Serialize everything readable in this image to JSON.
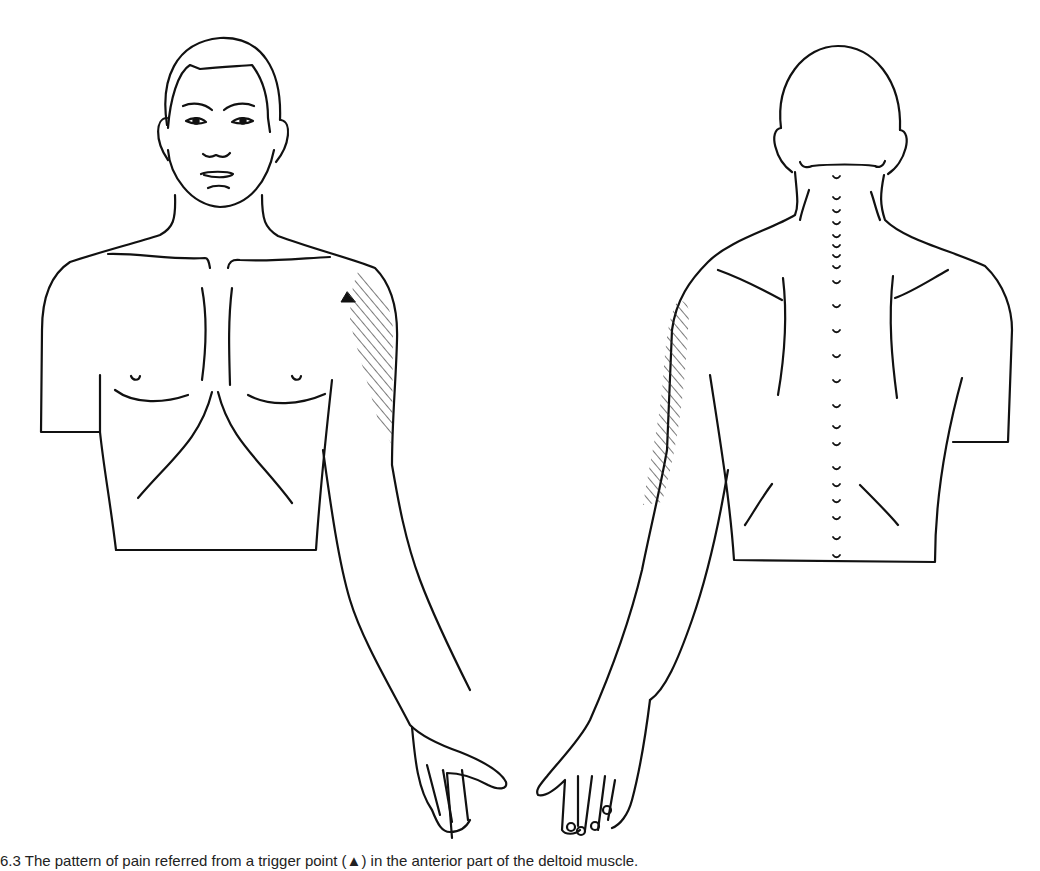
{
  "figure": {
    "views": [
      {
        "id": "front",
        "label": "Anterior view"
      },
      {
        "id": "back",
        "label": "Posterior view"
      }
    ],
    "marker": {
      "symbol": "▲",
      "meaning": "trigger-point"
    },
    "colors": {
      "line": "#111111",
      "background": "#ffffff",
      "hatch": "#333333"
    }
  },
  "caption": "6.3  The pattern of pain referred from a trigger point (▲) in the anterior part of the deltoid muscle."
}
